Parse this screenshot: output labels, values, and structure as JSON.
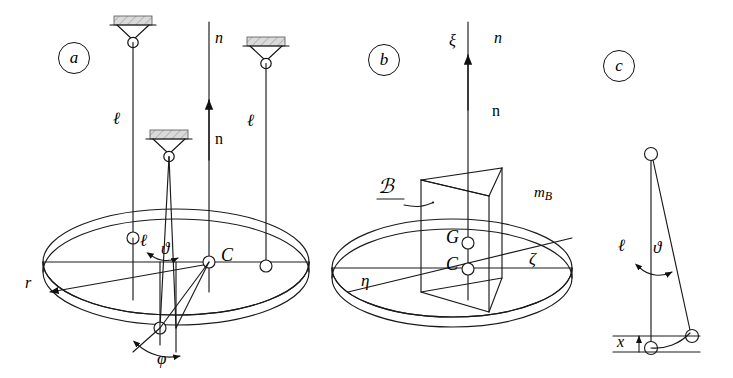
{
  "figure": {
    "type": "mechanics-diagram",
    "background": "#ffffff",
    "line_color": "#1a1a1a",
    "hatch_fill": "#d9d9d9",
    "width": 733,
    "height": 378
  },
  "panels": [
    {
      "id": "a",
      "label": "a",
      "description": "Three-wire (trifilar) suspension of a circular disc seen in perspective",
      "labels": [
        {
          "name": "wire-length-left",
          "text": "ℓ",
          "style": "italic"
        },
        {
          "name": "wire-length-right",
          "text": "ℓ",
          "style": "italic"
        },
        {
          "name": "wire-length-front",
          "text": "ℓ",
          "style": "italic"
        },
        {
          "name": "axis-n-italic",
          "text": "n",
          "style": "italic"
        },
        {
          "name": "axis-n-upright",
          "text": "n",
          "style": "upright"
        },
        {
          "name": "angle-theta",
          "text": "ϑ",
          "style": "italic"
        },
        {
          "name": "angle-phi",
          "text": "φ",
          "style": "italic"
        },
        {
          "name": "center-point-c",
          "text": "C",
          "style": "italic"
        },
        {
          "name": "radius-r",
          "text": "r",
          "style": "italic"
        }
      ]
    },
    {
      "id": "b",
      "label": "b",
      "description": "Disc carrying a triangular prism body B with body axes ξ, η, ζ",
      "labels": [
        {
          "name": "axis-xi",
          "text": "ξ",
          "style": "italic"
        },
        {
          "name": "axis-eta",
          "text": "η",
          "style": "italic"
        },
        {
          "name": "axis-zeta",
          "text": "ζ",
          "style": "italic"
        },
        {
          "name": "axis-n-italic",
          "text": "n",
          "style": "italic"
        },
        {
          "name": "axis-n-upright",
          "text": "n",
          "style": "upright"
        },
        {
          "name": "body-b",
          "text": "ℬ",
          "style": "script"
        },
        {
          "name": "mass-mb",
          "text": "m",
          "sub": "B",
          "style": "italic"
        },
        {
          "name": "point-g",
          "text": "G",
          "style": "italic"
        },
        {
          "name": "point-c",
          "text": "C",
          "style": "italic"
        }
      ]
    },
    {
      "id": "c",
      "label": "c",
      "description": "Detail of one suspension wire deflected by angle ϑ, raising the disc by x",
      "labels": [
        {
          "name": "wire-length",
          "text": "ℓ",
          "style": "italic"
        },
        {
          "name": "angle-theta",
          "text": "ϑ",
          "style": "italic"
        },
        {
          "name": "lift-x",
          "text": "x",
          "style": "italic"
        }
      ]
    }
  ],
  "symbols": {
    "wire_length": "ℓ",
    "theta": "ϑ",
    "phi": "φ",
    "xi": "ξ",
    "eta": "η",
    "zeta": "ζ",
    "script_b": "ℬ",
    "mass_b_base": "m",
    "mass_b_sub": "B",
    "point_g": "G",
    "point_c": "C",
    "radius": "r",
    "lift": "x",
    "axis_n": "n"
  }
}
